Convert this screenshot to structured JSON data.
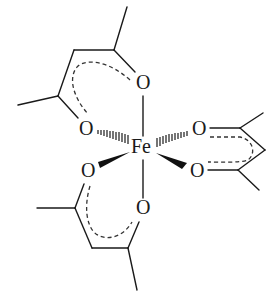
{
  "diagram": {
    "type": "chemical-structure",
    "center_atom": {
      "label": "Fe",
      "x": 141,
      "y": 151
    },
    "atoms": [
      {
        "id": "O1",
        "label": "O",
        "x": 143,
        "y": 89,
        "ligand": "top"
      },
      {
        "id": "O2",
        "label": "O",
        "x": 86,
        "y": 134,
        "ligand": "top"
      },
      {
        "id": "O3",
        "label": "O",
        "x": 199,
        "y": 135,
        "ligand": "right"
      },
      {
        "id": "O4",
        "label": "O",
        "x": 197,
        "y": 177,
        "ligand": "right"
      },
      {
        "id": "O5",
        "label": "O",
        "x": 88,
        "y": 177,
        "ligand": "bottom"
      },
      {
        "id": "O6",
        "label": "O",
        "x": 143,
        "y": 214,
        "ligand": "bottom"
      }
    ],
    "labels": {
      "fe": "Fe",
      "o1": "O",
      "o2": "O",
      "o3": "O",
      "o4": "O",
      "o5": "O",
      "o6": "O"
    },
    "bond_styles": {
      "O1-Fe": "plain",
      "O6-Fe": "plain",
      "O2-Fe": "hashed",
      "O3-Fe": "hashed",
      "O5-Fe": "wedge",
      "O4-Fe": "wedge"
    },
    "ligands": [
      "acac (top)",
      "acac (right)",
      "acac (bottom)"
    ],
    "colors": {
      "ink": "#1a1a1a",
      "background": "#ffffff"
    }
  }
}
